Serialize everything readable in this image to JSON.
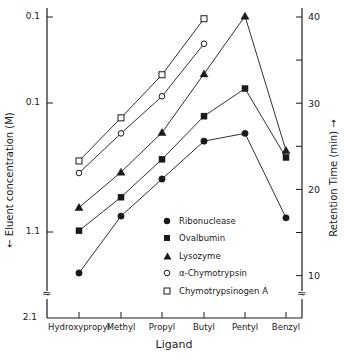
{
  "chart_data": {
    "type": "line",
    "title": "",
    "xlabel": "Ligand",
    "ylabel_left": "← Eluent concentration (M)",
    "ylabel_right": "Retention Time (min) →",
    "categories": [
      "Hydroxypropyl",
      "Methyl",
      "Propyl",
      "Butyl",
      "Pentyl",
      "Benzyl"
    ],
    "left_axis_ticks": [
      "0.1",
      "0.1",
      "1.1",
      "2.1"
    ],
    "right_axis_ticks": [
      40,
      30,
      20,
      10
    ],
    "right_axis_range": [
      7,
      40
    ],
    "grid": false,
    "legend_position": "lower-center inside plot",
    "series": [
      {
        "name": "Ribonuclease",
        "marker": "filled-circle",
        "values": [
          10.3,
          16.9,
          21.2,
          25.6,
          26.5,
          16.7
        ]
      },
      {
        "name": "Ovalbumin",
        "marker": "filled-square",
        "values": [
          15.2,
          19.1,
          23.5,
          28.5,
          31.7,
          23.7
        ]
      },
      {
        "name": "Lysozyme",
        "marker": "filled-triangle",
        "values": [
          17.9,
          22.0,
          26.6,
          33.4,
          40.1,
          24.5
        ]
      },
      {
        "name": "α-Chymotrypsin",
        "marker": "open-circle",
        "values": [
          21.9,
          26.5,
          30.8,
          36.9,
          null,
          null
        ]
      },
      {
        "name": "Chymotrypsinogen A",
        "marker": "open-square",
        "values": [
          23.3,
          28.3,
          33.3,
          39.8,
          null,
          null
        ]
      }
    ]
  },
  "axis": {
    "left_ticks": [
      "0.1",
      "0.1",
      "1.1",
      "2.1"
    ],
    "right_ticks": [
      "40",
      "30",
      "20",
      "10"
    ],
    "break_symbol": "≈"
  },
  "labels": {
    "xlabel": "Ligand",
    "ylabel_left": "←  Eluent concentration  (M)",
    "ylabel_right": "Retention  Time  (min)  →"
  },
  "legend": [
    {
      "label": "Ribonuclease",
      "marker": "filled-circle"
    },
    {
      "label": "Ovalbumin",
      "marker": "filled-square"
    },
    {
      "label": "Lysozyme",
      "marker": "filled-triangle"
    },
    {
      "label": "α-Chymotrypsin",
      "marker": "open-circle"
    },
    {
      "label": "Chymotrypsinogen A",
      "marker": "open-square"
    }
  ],
  "colors": {
    "ink": "#1a1a1a",
    "background": "#ffffff"
  }
}
